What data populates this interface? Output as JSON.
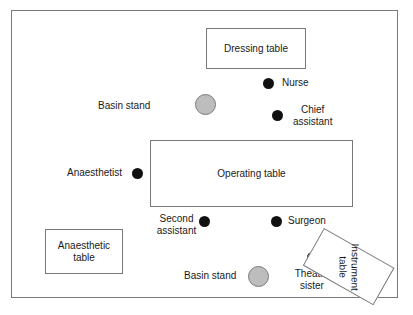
{
  "diagram": {
    "type": "floor-plan",
    "colors": {
      "line": "#77797c",
      "text": "#1a1a1a",
      "person_marker": "#111111",
      "basin_fill": "#bdbdbd",
      "basin_stroke": "#7a7a7a",
      "background": "#ffffff"
    },
    "room": {
      "label": ""
    },
    "furniture": [
      {
        "id": "dressing-table",
        "label": "Dressing table",
        "shape": "rectangle",
        "rotation_deg": 0
      },
      {
        "id": "operating-table",
        "label": "Operating table",
        "shape": "rectangle",
        "rotation_deg": 0
      },
      {
        "id": "anaesthetic-table",
        "label": "Anaesthetic\ntable",
        "label_line1": "Anaesthetic",
        "label_line2": "table",
        "shape": "rectangle",
        "rotation_deg": 0
      },
      {
        "id": "instrument-table",
        "label": "Instrument table",
        "label_line1": "Instrument",
        "label_line2": "table",
        "shape": "rectangle",
        "rotation_deg": 29.5
      }
    ],
    "equipment": [
      {
        "id": "basin-stand-top",
        "label": "Basin stand",
        "shape": "circle"
      },
      {
        "id": "basin-stand-bottom",
        "label": "Basin stand",
        "shape": "circle"
      }
    ],
    "people": [
      {
        "id": "nurse",
        "label": "Nurse",
        "marker": "filled-circle"
      },
      {
        "id": "chief-assistant",
        "label": "Chief assistant",
        "label_line1": "Chief",
        "label_line2": "assistant",
        "marker": "filled-circle"
      },
      {
        "id": "anaesthetist",
        "label": "Anaesthetist",
        "marker": "filled-circle"
      },
      {
        "id": "second-assistant",
        "label": "Second assistant",
        "label_line1": "Second",
        "label_line2": "assistant",
        "marker": "filled-circle"
      },
      {
        "id": "surgeon",
        "label": "Surgeon",
        "marker": "filled-circle"
      },
      {
        "id": "theatre-sister",
        "label": "Theatre sister",
        "label_line1": "Theatre",
        "label_line2": "sister",
        "marker": "filled-circle"
      }
    ]
  }
}
